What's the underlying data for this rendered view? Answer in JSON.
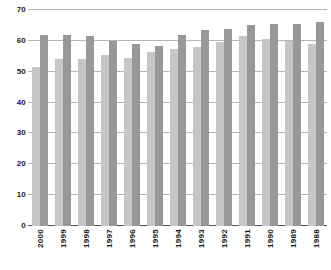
{
  "chart_data": {
    "type": "bar",
    "title": "",
    "subtitle": "",
    "xlabel": "",
    "ylabel": "",
    "ylim": [
      0,
      70
    ],
    "yticks": [
      0,
      10,
      20,
      30,
      40,
      50,
      60,
      70
    ],
    "grid": true,
    "legend": "none",
    "orientation": "vertical",
    "grouping": "grouped",
    "categories": [
      "2000",
      "1999",
      "1998",
      "1997",
      "1996",
      "1995",
      "1994",
      "1993",
      "1992",
      "1991",
      "1990",
      "1989",
      "1988"
    ],
    "series": [
      {
        "name": "series-1",
        "color": "#c6c6c6",
        "values": [
          51.5,
          54.0,
          54.0,
          55.5,
          54.5,
          56.5,
          57.5,
          58.0,
          59.5,
          61.5,
          60.5,
          60.0,
          59.0
        ]
      },
      {
        "name": "series-2",
        "color": "#989898",
        "values": [
          62.0,
          62.0,
          61.5,
          60.0,
          59.0,
          58.5,
          62.0,
          63.5,
          64.0,
          65.0,
          65.5,
          65.5,
          66.0
        ]
      }
    ]
  },
  "colors": {
    "series_1": "#c6c6c6",
    "series_2": "#989898",
    "gridline": "#b4b4b4",
    "axis": "#555555",
    "text": "#1a1a1a",
    "background": "#ffffff"
  }
}
